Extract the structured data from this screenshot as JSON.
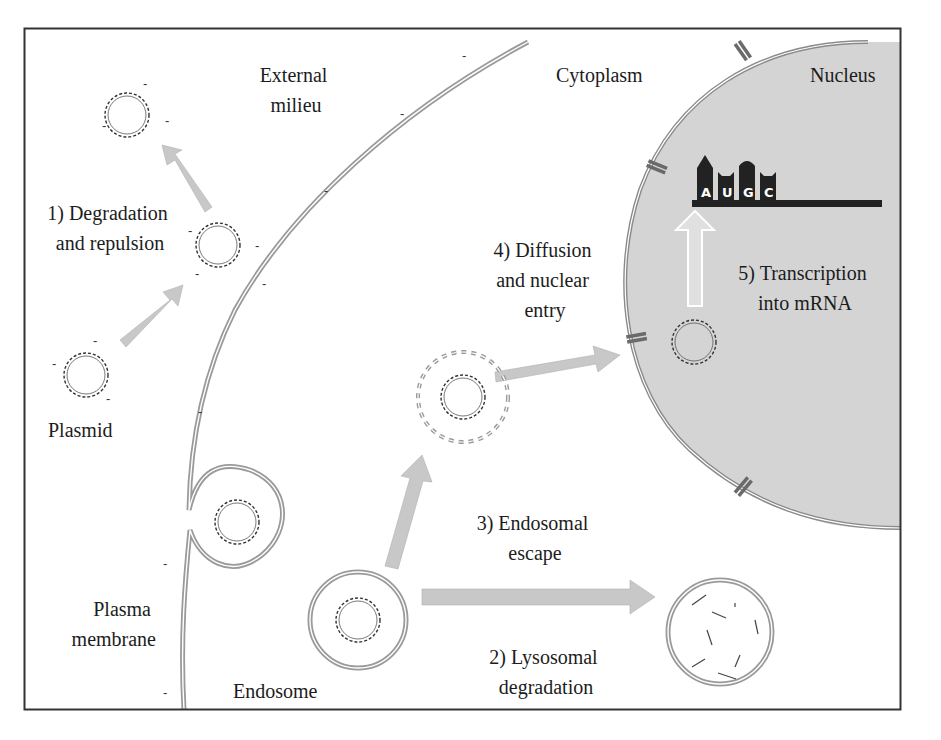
{
  "regions": {
    "external": "External milieu",
    "cytoplasm": "Cytoplasm",
    "nucleus": "Nucleus",
    "plasmid": "Plasmid",
    "plasma_membrane": "Plasma membrane",
    "endosome": "Endosome"
  },
  "region_lines": {
    "external": [
      "External",
      "milieu"
    ],
    "plasma_membrane": [
      "Plasma",
      "membrane"
    ]
  },
  "steps": [
    {
      "id": 1,
      "lines": [
        "1) Degradation",
        "and repulsion"
      ]
    },
    {
      "id": 2,
      "lines": [
        "2) Lysosomal",
        "degradation"
      ]
    },
    {
      "id": 3,
      "lines": [
        "3) Endosomal",
        "escape"
      ]
    },
    {
      "id": 4,
      "lines": [
        "4) Diffusion",
        "and nuclear",
        "entry"
      ]
    },
    {
      "id": 5,
      "lines": [
        "5) Transcription",
        "into mRNA"
      ]
    }
  ],
  "mrna": {
    "nucleotides": [
      "A",
      "U",
      "G",
      "C"
    ]
  },
  "charge_symbol": "-",
  "colors": {
    "frame": "#333333",
    "nucleus_fill": "#d4d4d4",
    "membrane": "#8a8a8a",
    "arrow": "#c8c8c8",
    "pore": "#6a6a6a",
    "mrna": "#222222"
  }
}
